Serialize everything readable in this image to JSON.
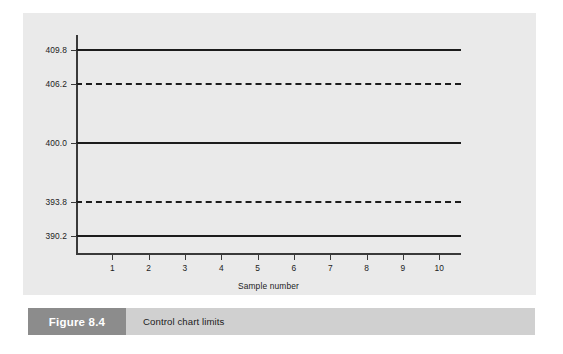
{
  "chart_data": {
    "type": "line",
    "title": "",
    "subtitle": "",
    "xlabel": "Sample number",
    "ylabel": "",
    "grid": false,
    "legend": "none",
    "xlim": [
      0,
      10.6
    ],
    "ylim": [
      388.4,
      411.4
    ],
    "x_ticks": [
      1,
      2,
      3,
      4,
      5,
      6,
      7,
      8,
      9,
      10
    ],
    "x_tick_labels": [
      "1",
      "2",
      "3",
      "4",
      "5",
      "6",
      "7",
      "8",
      "9",
      "10"
    ],
    "y_ticks": [
      390.2,
      393.8,
      400.0,
      406.2,
      409.8
    ],
    "y_tick_labels": [
      "390.2",
      "393.8",
      "400.0",
      "406.2",
      "409.8"
    ],
    "series": [
      {
        "name": "Upper action limit",
        "value": 409.8,
        "label": "409.8",
        "style": "solid",
        "color": "#1c1c1c"
      },
      {
        "name": "Upper warning limit",
        "value": 406.2,
        "label": "406.2",
        "style": "dashed",
        "color": "#1c1c1c"
      },
      {
        "name": "Centre line",
        "value": 400.0,
        "label": "400.0",
        "style": "solid",
        "color": "#1c1c1c"
      },
      {
        "name": "Lower warning limit",
        "value": 393.8,
        "label": "393.8",
        "style": "dashed",
        "color": "#1c1c1c"
      },
      {
        "name": "Lower action limit",
        "value": 390.2,
        "label": "390.2",
        "style": "solid",
        "color": "#1c1c1c"
      }
    ]
  },
  "caption": {
    "figure_label": "Figure 8.4",
    "text": "Control chart limits"
  },
  "colors": {
    "panel_background": "#eaeaea",
    "caption_bar": "#d0d0d0",
    "caption_box": "#8c8c8c",
    "caption_box_text": "#ffffff",
    "axis": "#3a3a3a",
    "line": "#1c1c1c",
    "page_background": "#ffffff"
  }
}
